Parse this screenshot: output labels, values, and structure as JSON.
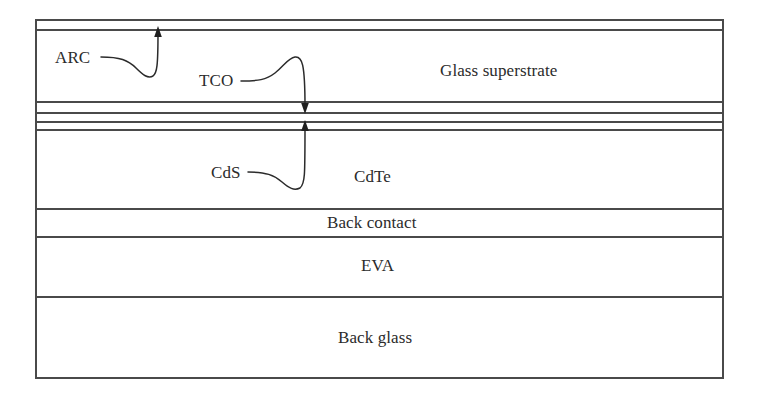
{
  "figure": {
    "kind": "layer-stack-cross-section",
    "background_color": "#ffffff",
    "line_color": "#4a4a4a",
    "text_color": "#2b2b2b"
  },
  "layers": [
    {
      "id": "arc",
      "name": "ARC",
      "label_style": "callout",
      "top": 20,
      "bottom": 30
    },
    {
      "id": "glass-superstrate",
      "name": "Glass superstrate",
      "label_style": "inline",
      "top": 30,
      "bottom": 102
    },
    {
      "id": "tco",
      "name": "TCO",
      "label_style": "callout",
      "top": 102,
      "bottom": 113
    },
    {
      "id": "interlayer",
      "name": "",
      "label_style": "none",
      "top": 113,
      "bottom": 122
    },
    {
      "id": "cds",
      "name": "CdS",
      "label_style": "callout",
      "top": 122,
      "bottom": 130
    },
    {
      "id": "cdte",
      "name": "CdTe",
      "label_style": "inline",
      "top": 130,
      "bottom": 209
    },
    {
      "id": "back-contact",
      "name": "Back contact",
      "label_style": "inline",
      "top": 209,
      "bottom": 237
    },
    {
      "id": "eva",
      "name": "EVA",
      "label_style": "inline",
      "top": 237,
      "bottom": 297
    },
    {
      "id": "back-glass",
      "name": "Back glass",
      "label_style": "inline",
      "top": 297,
      "bottom": 378
    }
  ],
  "inline_labels": {
    "glass_superstrate": "Glass superstrate",
    "cdte": "CdTe",
    "back_contact": "Back contact",
    "eva": "EVA",
    "back_glass": "Back glass"
  },
  "callout_labels": {
    "arc": "ARC",
    "tco": "TCO",
    "cds": "CdS"
  },
  "callouts": [
    {
      "id": "arc-callout",
      "label": "ARC",
      "arrow_direction": "up",
      "arrow_x": 158,
      "arrow_tip_y": 28,
      "points_to_layer": "arc"
    },
    {
      "id": "tco-callout",
      "label": "TCO",
      "arrow_direction": "down",
      "arrow_x": 305,
      "arrow_tip_y": 113,
      "points_to_layer": "tco"
    },
    {
      "id": "cds-callout",
      "label": "CdS",
      "arrow_direction": "up",
      "arrow_x": 305,
      "arrow_tip_y": 122,
      "points_to_layer": "cds"
    }
  ],
  "frame": {
    "left": 36,
    "right": 723,
    "top": 20,
    "bottom": 378
  }
}
